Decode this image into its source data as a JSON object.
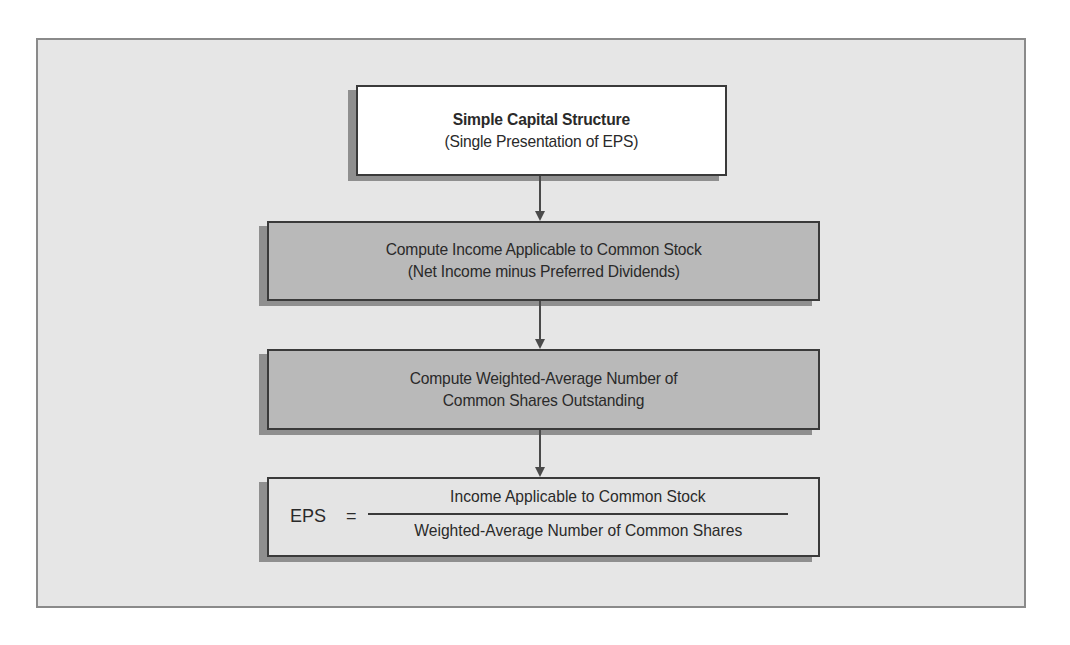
{
  "diagram": {
    "type": "flowchart",
    "direction": "top-to-bottom",
    "colors": {
      "panel_bg": "#e6e6e6",
      "panel_border": "#8a8a8a",
      "box_border": "#3a3a3a",
      "shadow": "#8f8f8f",
      "start_box_fill": "#ffffff",
      "process_box_fill": "#b9b9b9",
      "result_box_fill": "#e4e4e4",
      "arrow": "#4a4a4a"
    },
    "nodes": [
      {
        "id": "simple-capital-structure",
        "title": "Simple Capital Structure",
        "subtitle": "(Single Presentation of EPS)"
      },
      {
        "id": "compute-income",
        "line1": "Compute Income Applicable to Common Stock",
        "line2": "(Net Income minus Preferred Dividends)"
      },
      {
        "id": "compute-weighted-average",
        "line1": "Compute Weighted-Average Number of",
        "line2": "Common Shares Outstanding"
      },
      {
        "id": "eps-formula",
        "lhs": "EPS",
        "equals": "=",
        "numerator": "Income Applicable to Common Stock",
        "denominator": "Weighted-Average Number of Common Shares"
      }
    ],
    "edges": [
      {
        "from": "simple-capital-structure",
        "to": "compute-income"
      },
      {
        "from": "compute-income",
        "to": "compute-weighted-average"
      },
      {
        "from": "compute-weighted-average",
        "to": "eps-formula"
      }
    ]
  }
}
